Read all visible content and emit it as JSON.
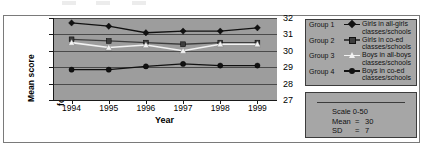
{
  "chart_data": {
    "type": "line",
    "title": "",
    "xlabel": "Year",
    "ylabel_line1": "Mean score",
    "ylabel_line2": "for 53 studies",
    "categories": [
      "1994",
      "1995",
      "1996",
      "1997",
      "1998",
      "1999"
    ],
    "ylim": [
      27,
      32
    ],
    "yticks": [
      "27",
      "28",
      "29",
      "30",
      "31",
      "32"
    ],
    "grid": true,
    "legend_position": "right",
    "plot_background": "#9d9d9d",
    "series": [
      {
        "name": "Group 1",
        "label": "Girls in all-girls\nclasses/schools",
        "marker": "diamond",
        "color": "#111111",
        "values": [
          31.7,
          31.5,
          31.1,
          31.2,
          31.2,
          31.4
        ]
      },
      {
        "name": "Group 2",
        "label": "Girls in co-ed\nclasses/schools",
        "marker": "square",
        "color": "#3d3d3d",
        "values": [
          30.7,
          30.6,
          30.5,
          30.4,
          30.5,
          30.5
        ]
      },
      {
        "name": "Group 3",
        "label": "Boys in all-boys\nclasses/schools",
        "marker": "triangle",
        "color": "#f2f2f2",
        "values": [
          30.5,
          30.2,
          30.35,
          30.0,
          30.4,
          30.4
        ]
      },
      {
        "name": "Group 4",
        "label": "Boys in co-ed\nclasses/schools",
        "marker": "circle",
        "color": "#111111",
        "values": [
          28.85,
          28.85,
          29.05,
          29.2,
          29.1,
          29.1
        ]
      }
    ]
  },
  "stats": {
    "scale_label": "Scale 0-50",
    "mean_key": "Mean",
    "mean_eq": "=",
    "mean_value": "30",
    "sd_key": "SD",
    "sd_eq": "=",
    "sd_value": "7"
  }
}
